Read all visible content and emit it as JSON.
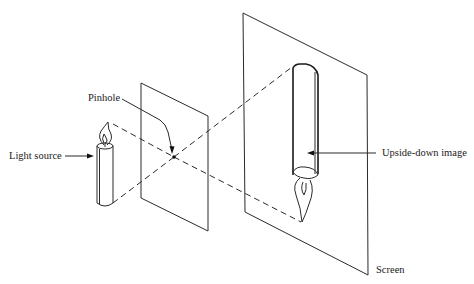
{
  "diagram": {
    "labels": {
      "pinhole": "Pinhole",
      "light_source": "Light source",
      "upside_down_image": "Upside-down image",
      "screen": "Screen"
    },
    "elements": [
      {
        "id": "candle",
        "role": "light source",
        "orientation": "upright"
      },
      {
        "id": "pinhole-plate",
        "role": "opaque plate with pinhole"
      },
      {
        "id": "screen",
        "role": "projection screen"
      },
      {
        "id": "inverted-candle",
        "role": "projected image",
        "orientation": "upside-down"
      }
    ],
    "rays": [
      {
        "from": "candle-flame-top",
        "through": "pinhole",
        "to": "image-top",
        "style": "dashed"
      },
      {
        "from": "candle-base",
        "through": "pinhole",
        "to": "image-flame-tip",
        "style": "dashed"
      }
    ],
    "colors": {
      "stroke": "#2a2a2a",
      "background": "#ffffff"
    }
  }
}
